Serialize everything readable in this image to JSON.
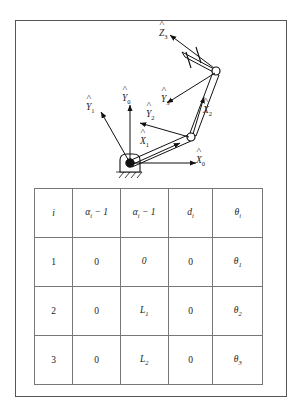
{
  "figure": {
    "name": "three-link-planar-manipulator-dh-figure",
    "diagram": {
      "title": "",
      "frames": [
        {
          "id": "Y0",
          "symbol": "Y",
          "subscript": "0",
          "hat": true
        },
        {
          "id": "X0",
          "symbol": "X",
          "subscript": "0",
          "hat": true
        },
        {
          "id": "Y1",
          "symbol": "Y",
          "subscript": "1",
          "hat": true
        },
        {
          "id": "X1",
          "symbol": "X",
          "subscript": "1",
          "hat": true
        },
        {
          "id": "Y2",
          "symbol": "Y",
          "subscript": "2",
          "hat": true
        },
        {
          "id": "X2",
          "symbol": "X",
          "subscript": "2",
          "hat": true
        },
        {
          "id": "Y3",
          "symbol": "Y",
          "subscript": "3",
          "hat": true
        },
        {
          "id": "Z3",
          "symbol": "Z",
          "subscript": "3",
          "hat": true
        }
      ],
      "labels": {
        "y0": "Y",
        "y0_sub": "0",
        "x0": "X",
        "x0_sub": "0",
        "y1": "Y",
        "y1_sub": "1",
        "x1": "X",
        "x1_sub": "1",
        "y2": "Y",
        "y2_sub": "2",
        "x2": "X",
        "x2_sub": "2",
        "y3": "Y",
        "y3_sub": "3",
        "z3": "Z",
        "z3_sub": "3"
      }
    },
    "table": {
      "name": "dh-parameter-table",
      "columns": [
        {
          "key": "i",
          "symbol": "i",
          "sub": "",
          "suffix": ""
        },
        {
          "key": "alpha",
          "symbol": "α",
          "sub": "i",
          "suffix": " − 1"
        },
        {
          "key": "a",
          "symbol": "α",
          "sub": "i",
          "suffix": " − 1"
        },
        {
          "key": "d",
          "symbol": "d",
          "sub": "i",
          "suffix": ""
        },
        {
          "key": "theta",
          "symbol": "θ",
          "sub": "i",
          "suffix": ""
        }
      ],
      "header": {
        "c0": "i",
        "c1_sym": "α",
        "c1_sub": "i",
        "c1_suf": " − 1",
        "c2_sym": "α",
        "c2_sub": "i",
        "c2_suf": " − 1",
        "c3_sym": "d",
        "c3_sub": "i",
        "c4_sym": "θ",
        "c4_sub": "i"
      },
      "rows": [
        {
          "i": "1",
          "alpha": "0",
          "a": "0",
          "a_sub": "",
          "d": "0",
          "theta": "θ",
          "theta_sub": "1"
        },
        {
          "i": "2",
          "alpha": "0",
          "a": "L",
          "a_sub": "1",
          "d": "0",
          "theta": "θ",
          "theta_sub": "2"
        },
        {
          "i": "3",
          "alpha": "0",
          "a": "L",
          "a_sub": "2",
          "d": "0",
          "theta": "θ",
          "theta_sub": "3"
        }
      ]
    },
    "colors": {
      "frame_border": "#555555",
      "table_border": "#777777",
      "ink": "#1a1a1a",
      "background": "#ffffff"
    }
  }
}
